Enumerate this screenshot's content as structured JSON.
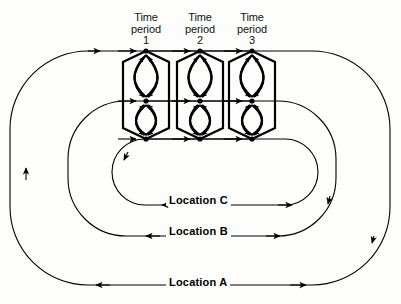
{
  "figure": {
    "type": "diagram",
    "subtype": "nested-loop-lattice",
    "background_color": "#fdfdfc",
    "line_color": "#000000"
  },
  "period_labels": [
    {
      "line1": "Time",
      "line2": "period",
      "line3": "1",
      "x": 146
    },
    {
      "line1": "Time",
      "line2": "period",
      "line3": "2",
      "x": 200
    },
    {
      "line1": "Time",
      "line2": "period",
      "line3": "3",
      "x": 252
    }
  ],
  "location_labels": [
    {
      "text": "Location C",
      "x": 216,
      "y": 200
    },
    {
      "text": "Location B",
      "x": 216,
      "y": 231
    },
    {
      "text": "Location A",
      "x": 216,
      "y": 282
    }
  ],
  "loops": [
    {
      "name": "Location A",
      "left": 10,
      "right": 390,
      "top": 51,
      "bottom": 285,
      "radius": 78
    },
    {
      "name": "Location B",
      "left": 68,
      "right": 336,
      "top": 101,
      "bottom": 236,
      "radius": 58
    },
    {
      "name": "Location C",
      "left": 112,
      "right": 318,
      "top": 139,
      "bottom": 205,
      "radius": 33
    }
  ],
  "columns": [
    {
      "period": "1",
      "center_x": 146,
      "half_width": 23
    },
    {
      "period": "2",
      "center_x": 200,
      "half_width": 23
    },
    {
      "period": "3",
      "center_x": 252,
      "half_width": 23
    }
  ],
  "rails": [
    {
      "name": "top-rail",
      "y": 51,
      "location": "Location A"
    },
    {
      "name": "middle-rail",
      "y": 101,
      "location": "Location B"
    },
    {
      "name": "bottom-rail",
      "y": 139,
      "location": "Location C"
    }
  ]
}
